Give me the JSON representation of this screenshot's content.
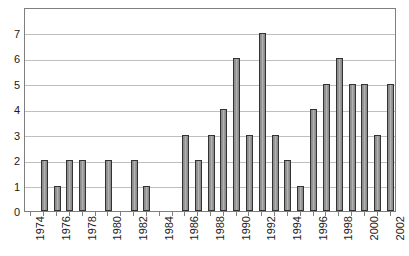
{
  "chart_data": {
    "type": "bar",
    "title": "",
    "subtitle": "",
    "xlabel": "",
    "ylabel": "",
    "categories": [
      "1974",
      "1975",
      "1976",
      "1977",
      "1978",
      "1979",
      "1980",
      "1981",
      "1982",
      "1983",
      "1984",
      "1985",
      "1986",
      "1987",
      "1988",
      "1989",
      "1990",
      "1991",
      "1992",
      "1993",
      "1994",
      "1995",
      "1996",
      "1997",
      "1998",
      "1999",
      "2000",
      "2001",
      "2002"
    ],
    "values": [
      0,
      2,
      1,
      2,
      2,
      0,
      2,
      0,
      2,
      1,
      0,
      0,
      3,
      2,
      3,
      4,
      6,
      3,
      7,
      3,
      2,
      1,
      4,
      5,
      6,
      5,
      5,
      3,
      5
    ],
    "ylim": [
      0,
      8
    ],
    "ytick_labels": [
      "0",
      "1",
      "2",
      "3",
      "4",
      "5",
      "6",
      "7"
    ],
    "ytick_values": [
      0,
      1,
      2,
      3,
      4,
      5,
      6,
      7
    ],
    "xtick_labels": [
      "1974",
      "1976",
      "1978",
      "1980",
      "1982",
      "1984",
      "1986",
      "1988",
      "1990",
      "1992",
      "1994",
      "1996",
      "1998",
      "2000",
      "2002"
    ],
    "xtick_label_interval": 2,
    "xtick_label_rotation": -90,
    "grid": true,
    "grid_axis": "y",
    "legend": null,
    "legend_position": "none",
    "annotations": [],
    "colors": {
      "bar_fill": "#9a9a9a",
      "bar_edge": "#333333",
      "gridline": "#bfbfbf",
      "axis_border": "#7f7f7f",
      "text": "#1a1a1a",
      "background": "#ffffff"
    }
  }
}
